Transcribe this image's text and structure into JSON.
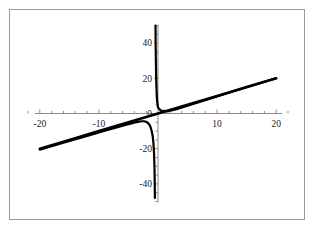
{
  "figure": {
    "background_color": "#ffffff",
    "frame_border_color": "#9a9a9a"
  },
  "chart_data": {
    "type": "line",
    "title": "",
    "subtitle": "",
    "xlabel": "",
    "ylabel": "",
    "xlim": [
      -22,
      22
    ],
    "ylim": [
      -52,
      52
    ],
    "xticks": [
      -20,
      -10,
      10,
      20
    ],
    "yticks": [
      40,
      20,
      0,
      -20,
      -40
    ],
    "xtick_labels": [
      "-20",
      "-10",
      "10",
      "20"
    ],
    "ytick_labels": [
      "40",
      "20",
      "0",
      "-20",
      "-40"
    ],
    "minor_tick_interval_x": 2,
    "minor_tick_interval_y": 5,
    "grid": false,
    "legend": null,
    "axis_color": "#8c8c8c",
    "curve_color": "#000000",
    "series": [
      {
        "name": "line",
        "description": "straight line through origin, slope 1",
        "style": "solid",
        "color": "#000000",
        "width": 2.6,
        "x": [
          -20,
          -15,
          -10,
          -5,
          0,
          5,
          10,
          15,
          20
        ],
        "values": [
          -20,
          -15,
          -10,
          -5,
          0,
          5,
          10,
          15,
          20
        ]
      },
      {
        "name": "rational-curve-upper-branch",
        "description": "branch right of vertical asymptote near x = -0.5, descends from +50 and flattens toward the line",
        "style": "solid",
        "color": "#000000",
        "width": 2.2,
        "x": [
          -0.42,
          -0.4,
          -0.36,
          -0.32,
          -0.28,
          -0.22,
          -0.15,
          0,
          0.5,
          1.5,
          3,
          5,
          8,
          12,
          16,
          20
        ],
        "values": [
          50,
          40,
          30,
          22,
          16,
          11,
          7,
          3.4,
          1.6,
          1.2,
          2.3,
          4.4,
          7.6,
          11.8,
          15.9,
          20
        ]
      },
      {
        "name": "rational-curve-lower-branch",
        "description": "branch left of vertical asymptote near x = -0.5, rises from the line then plunges below -45",
        "style": "solid",
        "color": "#000000",
        "width": 2.2,
        "x": [
          -20,
          -16,
          -12,
          -9,
          -7,
          -5.5,
          -4.5,
          -3.8,
          -3.2,
          -2.8,
          -2.4,
          -2.0,
          -1.7,
          -1.45,
          -1.25,
          -1.05,
          -0.9,
          -0.78,
          -0.68,
          -0.6,
          -0.55,
          -0.52
        ],
        "values": [
          -20.5,
          -16.6,
          -12.7,
          -9.8,
          -7.9,
          -6.5,
          -5.6,
          -5.0,
          -4.6,
          -4.4,
          -4.4,
          -4.7,
          -5.4,
          -6.4,
          -7.8,
          -10.2,
          -12.8,
          -16.5,
          -22.0,
          -30.0,
          -40.0,
          -48
        ]
      }
    ],
    "annotations": [
      {
        "name": "vertical-asymptote",
        "x": -0.5,
        "style": "implied"
      }
    ]
  }
}
